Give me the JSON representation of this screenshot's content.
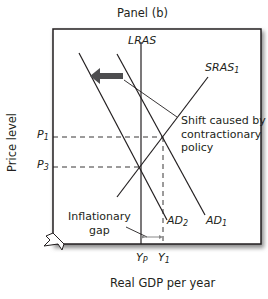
{
  "panel_title": "Panel (b)",
  "axes": {
    "y_label": "Price level",
    "x_label": "Real GDP per year"
  },
  "curves": {
    "lras": "LRAS",
    "sras": {
      "main": "SRAS",
      "sub": "1"
    },
    "ad1": {
      "main": "AD",
      "sub": "1"
    },
    "ad2": {
      "main": "AD",
      "sub": "2"
    }
  },
  "ticks": {
    "p1": {
      "main": "P",
      "sub": "1"
    },
    "p3": {
      "main": "P",
      "sub": "3"
    },
    "yp": {
      "main": "Y",
      "sub": "P"
    },
    "y1": {
      "main": "Y",
      "sub": "1"
    }
  },
  "annotations": {
    "shift_line1": "Shift caused by",
    "shift_line2": "contractionary",
    "shift_line3": "policy",
    "gap_line1": "Inflationary",
    "gap_line2": "gap"
  },
  "colors": {
    "line": "#231f20",
    "arrow": "#4d4d4f",
    "frame_shadow": "#9a9a9a"
  }
}
